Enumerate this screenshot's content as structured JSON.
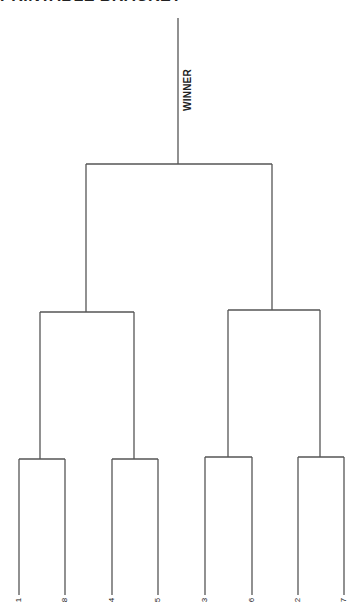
{
  "header": {
    "title": "PRINTABLE BRACKET"
  },
  "bracket": {
    "winner_label": "WINNER",
    "seeds": [
      "1",
      "8",
      "4",
      "5",
      "3",
      "6",
      "2",
      "7"
    ],
    "rounds": [
      "First Round",
      "Semifinals",
      "Final",
      "Winner"
    ],
    "line_color": "#555555"
  }
}
